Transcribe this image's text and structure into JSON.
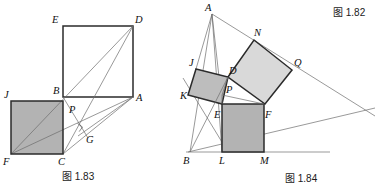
{
  "page": {
    "width": 375,
    "height": 186,
    "background": "#ffffff",
    "corner_label": "图 1.82"
  },
  "colors": {
    "shade_dark": "#b3b3b3",
    "shade_medium": "#bdbdbd",
    "shade_light": "#d9d9d9",
    "stroke_heavy": "#2b2b2b",
    "stroke_thin": "#6d6d6d",
    "text": "#111111"
  },
  "figures": [
    {
      "id": "fig-1-83",
      "caption": "图 1.83",
      "caption_pos": {
        "x": 62,
        "y": 179
      },
      "points": {
        "A": {
          "x": 133,
          "y": 97,
          "label": "A",
          "lx": 136,
          "ly": 101
        },
        "B": {
          "x": 63,
          "y": 97,
          "label": "B",
          "lx": 53,
          "ly": 94
        },
        "C": {
          "x": 63,
          "y": 154,
          "label": "C",
          "lx": 58,
          "ly": 165
        },
        "D": {
          "x": 133,
          "y": 26,
          "label": "D",
          "lx": 135,
          "ly": 23
        },
        "E": {
          "x": 63,
          "y": 26,
          "label": "E",
          "lx": 52,
          "ly": 23
        },
        "F": {
          "x": 11,
          "y": 154,
          "label": "F",
          "lx": 3,
          "ly": 165
        },
        "G": {
          "x": 84,
          "y": 131,
          "label": "G",
          "lx": 86,
          "ly": 143
        },
        "J": {
          "x": 11,
          "y": 101,
          "label": "J",
          "lx": 4,
          "ly": 98
        },
        "P": {
          "x": 74,
          "y": 120,
          "label": "P",
          "lx": 70,
          "ly": 112
        }
      },
      "shaded_squares": [
        {
          "name": "square-JBCF",
          "pts": "J,B,C,F",
          "fill": "shade_dark"
        }
      ],
      "outline_squares": [
        {
          "name": "square-BEDA",
          "pts": "B,E,D,A"
        }
      ],
      "segments": [
        {
          "name": "segment-F-A",
          "from": "F",
          "to": "A"
        },
        {
          "name": "segment-F-D",
          "from": "F",
          "to": "D"
        },
        {
          "name": "segment-C-D",
          "from": "C",
          "to": "D"
        },
        {
          "name": "segment-C-A",
          "from": "C",
          "to": "A"
        },
        {
          "name": "segment-B-G",
          "from": "B",
          "to": "G"
        },
        {
          "name": "segment-A-G",
          "from": "A",
          "to": "G"
        }
      ],
      "right_angle_marks": [
        {
          "name": "right-angle-at-G",
          "at": "G"
        }
      ]
    },
    {
      "id": "fig-1-84",
      "caption": "图 1.84",
      "caption_pos": {
        "x": 288,
        "y": 181
      },
      "points": {
        "A": {
          "x": 212,
          "y": 14,
          "label": "A",
          "lx": 205,
          "ly": 11
        },
        "B": {
          "x": 190,
          "y": 152,
          "label": "B",
          "lx": 184,
          "ly": 164
        },
        "D": {
          "x": 228,
          "y": 77,
          "label": "D",
          "lx": 229,
          "ly": 74
        },
        "E": {
          "x": 222,
          "y": 104,
          "label": "E",
          "lx": 215,
          "ly": 117
        },
        "F": {
          "x": 264,
          "y": 104,
          "label": "F",
          "lx": 266,
          "ly": 117
        },
        "J": {
          "x": 196,
          "y": 69,
          "label": "J",
          "lx": 190,
          "ly": 66
        },
        "K": {
          "x": 188,
          "y": 95,
          "label": "K",
          "lx": 182,
          "ly": 98
        },
        "L": {
          "x": 222,
          "y": 152,
          "label": "L",
          "lx": 219,
          "ly": 164
        },
        "M": {
          "x": 264,
          "y": 152,
          "label": "M",
          "lx": 261,
          "ly": 164
        },
        "N": {
          "x": 254,
          "y": 40,
          "label": "N",
          "lx": 255,
          "ly": 36
        },
        "P": {
          "x": 222,
          "y": 95,
          "label": "P",
          "lx": 226,
          "ly": 92
        },
        "Q": {
          "x": 292,
          "y": 70,
          "label": "Q",
          "lx": 294,
          "ly": 66
        }
      },
      "shaded_squares": [
        {
          "name": "square-JDPK",
          "pts": "J,D,P,K",
          "fill": "shade_medium"
        },
        {
          "name": "square-DNQF",
          "pts": "D,N,Q,F",
          "fill": "shade_light"
        },
        {
          "name": "square-ELMF",
          "pts": "E,L,M,F",
          "fill": "shade_dark"
        }
      ],
      "outline_squares": [],
      "segments": [
        {
          "name": "segment-A-B",
          "from": "A",
          "to": "B"
        },
        {
          "name": "segment-A-E",
          "from": "A",
          "to": "E"
        },
        {
          "name": "segment-A-L",
          "from": "A",
          "to": "L"
        },
        {
          "name": "segment-A-Q-ext",
          "from": "A",
          "to": "Qext"
        },
        {
          "name": "segment-B-Fext",
          "from": "B",
          "to": "Fext"
        },
        {
          "name": "segment-B-D",
          "from": "B",
          "to": "D"
        },
        {
          "name": "segment-K-E",
          "from": "K",
          "to": "E"
        },
        {
          "name": "segment-J-A",
          "from": "J",
          "to": "A"
        },
        {
          "name": "segment-P-F",
          "from": "P",
          "to": "F"
        },
        {
          "name": "segment-E-F",
          "from": "E",
          "to": "F"
        },
        {
          "name": "segment-baseline",
          "from": "Bline",
          "to": "Mline"
        }
      ],
      "right_angle_marks": []
    }
  ]
}
